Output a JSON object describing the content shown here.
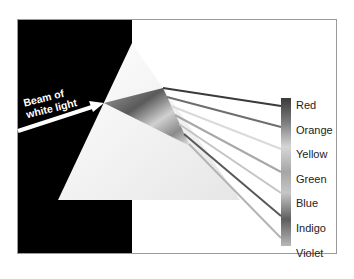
{
  "diagram": {
    "beam_label_line1": "Beam of",
    "beam_label_line2": "white light",
    "spectrum": [
      {
        "label": "Red",
        "ray_color": "#3a3a3a",
        "y": 106
      },
      {
        "label": "Orange",
        "ray_color": "#6e6e6e",
        "y": 127
      },
      {
        "label": "Yellow",
        "ray_color": "#d8d8d8",
        "y": 149
      },
      {
        "label": "Green",
        "ray_color": "#a8a8a8",
        "y": 172
      },
      {
        "label": "Blue",
        "ray_color": "#c4c4c4",
        "y": 193
      },
      {
        "label": "Indigo",
        "ray_color": "#585858",
        "y": 216
      },
      {
        "label": "Violet",
        "ray_color": "#b4b4b4",
        "y": 238
      }
    ],
    "colors": {
      "background_dark": "#000000",
      "frame": "#9a9a9a",
      "prism_light": "#ececec"
    }
  }
}
